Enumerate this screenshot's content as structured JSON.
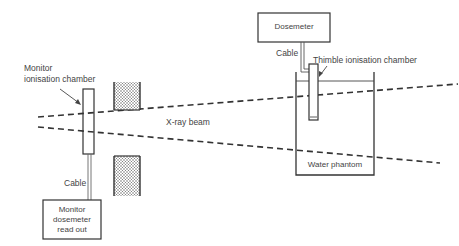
{
  "diagram": {
    "title": "",
    "components": {
      "monitor_chamber": {
        "label_line1": "Monitor",
        "label_line2": "ionisation chamber"
      },
      "beam": {
        "label": "X-ray beam"
      },
      "dosemeter": {
        "label": "Dosemeter"
      },
      "dosemeter_cable": {
        "label": "Cable"
      },
      "thimble_chamber": {
        "label": "Thimble ionisation chamber"
      },
      "water_phantom": {
        "label": "Water phantom"
      },
      "monitor_cable": {
        "label": "Cable"
      },
      "monitor_readout": {
        "line1": "Monitor",
        "line2": "dosemeter",
        "line3": "read out"
      }
    },
    "colors": {
      "stroke": "#333333",
      "text": "#444444",
      "fill_dots": "#555555"
    }
  }
}
